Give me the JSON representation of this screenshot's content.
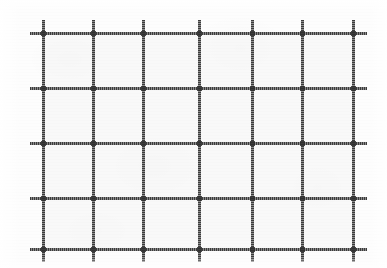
{
  "figure": {
    "kind": "grid-mesh-diagram",
    "caption": "",
    "width": 387,
    "height": 268,
    "background_color": "#fdfdfd",
    "paper_color": "#ffffff",
    "line_color": "#3b3b3b",
    "line_thickness": 3,
    "rendering": "scanned-halftone",
    "columns": 6,
    "rows": 4,
    "vertical_line_count": 7,
    "horizontal_line_count": 5,
    "cell_count": 24
  },
  "chart_data": {
    "type": "table",
    "title": "",
    "xlabel": "",
    "ylabel": "",
    "grid": true,
    "legend": "none",
    "vertical_lines": [
      {
        "id": "v1",
        "x": 43,
        "y_start": 20,
        "y_end": 262
      },
      {
        "id": "v2",
        "x": 93,
        "y_start": 20,
        "y_end": 262
      },
      {
        "id": "v3",
        "x": 143,
        "y_start": 20,
        "y_end": 262
      },
      {
        "id": "v4",
        "x": 199,
        "y_start": 20,
        "y_end": 262
      },
      {
        "id": "v5",
        "x": 252,
        "y_start": 20,
        "y_end": 262
      },
      {
        "id": "v6",
        "x": 302,
        "y_start": 20,
        "y_end": 262
      },
      {
        "id": "v7",
        "x": 353,
        "y_start": 20,
        "y_end": 262
      }
    ],
    "horizontal_lines": [
      {
        "id": "h1",
        "y": 33,
        "x_start": 30,
        "x_end": 367
      },
      {
        "id": "h2",
        "y": 88,
        "x_start": 30,
        "x_end": 367
      },
      {
        "id": "h3",
        "y": 143,
        "x_start": 30,
        "x_end": 367
      },
      {
        "id": "h4",
        "y": 198,
        "x_start": 30,
        "x_end": 367
      },
      {
        "id": "h5",
        "y": 249,
        "x_start": 30,
        "x_end": 367
      }
    ],
    "column_spacings": [
      50,
      50,
      56,
      53,
      50,
      51
    ],
    "row_spacings": [
      55,
      55,
      55,
      51
    ],
    "x": [
      43,
      93,
      143,
      199,
      252,
      302,
      353
    ],
    "y": [
      33,
      88,
      143,
      198,
      249
    ],
    "xlim": [
      30,
      367
    ],
    "ylim": [
      20,
      262
    ],
    "interior": {
      "left": 43,
      "top": 33,
      "right": 353,
      "bottom": 249
    }
  },
  "annotations": {
    "labels": [],
    "axis_tick_labels": [],
    "notes": []
  }
}
